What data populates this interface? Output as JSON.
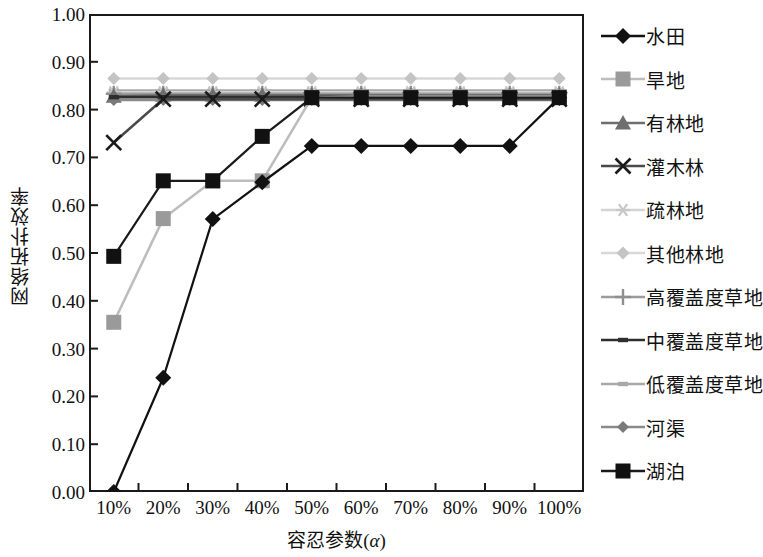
{
  "chart_data": {
    "type": "line",
    "title": "",
    "xlabel": "容忍参数(α)",
    "ylabel": "网络拓扑效率",
    "categories": [
      "10%",
      "20%",
      "30%",
      "40%",
      "50%",
      "60%",
      "70%",
      "80%",
      "90%",
      "100%"
    ],
    "x_values": [
      10,
      20,
      30,
      40,
      50,
      60,
      70,
      80,
      90,
      100
    ],
    "ylim": [
      0.0,
      1.0
    ],
    "ytick_labels": [
      "0.00",
      "0.10",
      "0.20",
      "0.30",
      "0.40",
      "0.50",
      "0.60",
      "0.70",
      "0.80",
      "0.90",
      "1.00"
    ],
    "ytick_values": [
      0.0,
      0.1,
      0.2,
      0.3,
      0.4,
      0.5,
      0.6,
      0.7,
      0.8,
      0.9,
      1.0
    ],
    "grid": false,
    "legend_position": "right",
    "series": [
      {
        "name": "水田",
        "marker": "diamond",
        "color": "#111111",
        "line_color": "#111111",
        "values": [
          0.0,
          0.239,
          0.571,
          0.648,
          0.724,
          0.724,
          0.724,
          0.724,
          0.724,
          0.825
        ]
      },
      {
        "name": "旱地",
        "marker": "square",
        "color": "#9a9a9a",
        "line_color": "#bdbdbd",
        "values": [
          0.355,
          0.572,
          0.651,
          0.651,
          0.825,
          0.827,
          0.827,
          0.827,
          0.827,
          0.827
        ]
      },
      {
        "name": "有林地",
        "marker": "triangle",
        "color": "#6e6e6e",
        "line_color": "#6e6e6e",
        "values": [
          0.828,
          0.83,
          0.83,
          0.83,
          0.83,
          0.83,
          0.83,
          0.83,
          0.83,
          0.83
        ]
      },
      {
        "name": "灌木林",
        "marker": "x",
        "color": "#1a1a1a",
        "line_color": "#4a4a4a",
        "values": [
          0.731,
          0.822,
          0.822,
          0.822,
          0.822,
          0.822,
          0.822,
          0.822,
          0.822,
          0.822
        ]
      },
      {
        "name": "疏林地",
        "marker": "asterisk",
        "color": "#c8c8c8",
        "line_color": "#d4d4d4",
        "values": [
          0.836,
          0.836,
          0.836,
          0.836,
          0.836,
          0.836,
          0.836,
          0.836,
          0.836,
          0.836
        ]
      },
      {
        "name": "其他林地",
        "marker": "diamond-small",
        "color": "#c4c4c4",
        "line_color": "#d8d8d8",
        "values": [
          0.865,
          0.865,
          0.865,
          0.865,
          0.865,
          0.865,
          0.865,
          0.865,
          0.865,
          0.865
        ]
      },
      {
        "name": "高覆盖度草地",
        "marker": "plus",
        "color": "#8f8f8f",
        "line_color": "#9c9c9c",
        "values": [
          0.833,
          0.833,
          0.833,
          0.833,
          0.833,
          0.833,
          0.833,
          0.833,
          0.833,
          0.833
        ]
      },
      {
        "name": "中覆盖度草地",
        "marker": "dash-dark",
        "color": "#2e2e2e",
        "line_color": "#2e2e2e",
        "values": [
          0.826,
          0.826,
          0.826,
          0.826,
          0.826,
          0.826,
          0.826,
          0.826,
          0.826,
          0.826
        ]
      },
      {
        "name": "低覆盖度草地",
        "marker": "dash-gray",
        "color": "#a8a8a8",
        "line_color": "#a8a8a8",
        "values": [
          0.84,
          0.84,
          0.84,
          0.84,
          0.84,
          0.84,
          0.84,
          0.84,
          0.84,
          0.84
        ]
      },
      {
        "name": "河渠",
        "marker": "diamond-mid",
        "color": "#7a7a7a",
        "line_color": "#8a8a8a",
        "values": [
          0.82,
          0.82,
          0.82,
          0.82,
          0.82,
          0.82,
          0.82,
          0.82,
          0.82,
          0.82
        ]
      },
      {
        "name": "湖泊",
        "marker": "square",
        "color": "#111111",
        "line_color": "#1a1a1a",
        "values": [
          0.493,
          0.651,
          0.651,
          0.744,
          0.825,
          0.825,
          0.825,
          0.825,
          0.825,
          0.825
        ]
      }
    ]
  },
  "legend": {
    "items": [
      {
        "label": "水田"
      },
      {
        "label": "旱地"
      },
      {
        "label": "有林地"
      },
      {
        "label": "灌木林"
      },
      {
        "label": "疏林地"
      },
      {
        "label": "其他林地"
      },
      {
        "label": "高覆盖度草地"
      },
      {
        "label": "中覆盖度草地"
      },
      {
        "label": "低覆盖度草地"
      },
      {
        "label": "河渠"
      },
      {
        "label": "湖泊"
      }
    ]
  },
  "axes": {
    "x_title_text": "容忍参数",
    "x_title_paren_open": "(",
    "x_title_symbol": "α",
    "x_title_paren_close": ")",
    "y_title": "网络拓扑效率"
  }
}
